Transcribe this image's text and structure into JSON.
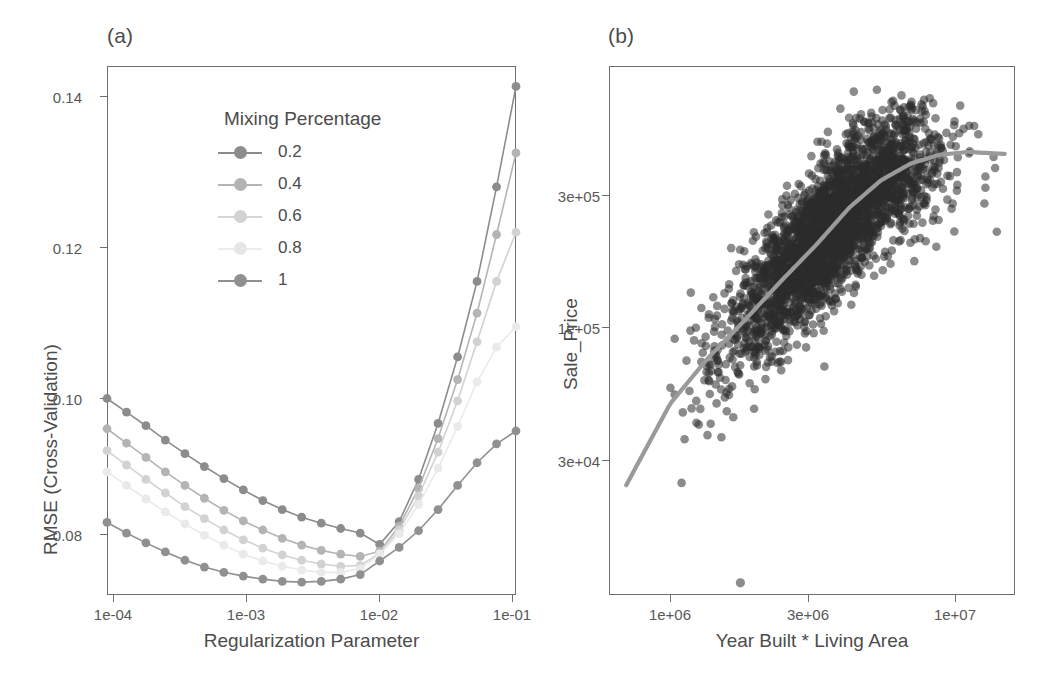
{
  "figure": {
    "panels": [
      {
        "tag": "(a)"
      },
      {
        "tag": "(b)"
      }
    ]
  },
  "chart_data": [
    {
      "type": "line",
      "panel": "(a)",
      "title": "",
      "xlabel": "Regularization Parameter",
      "ylabel": "RMSE (Cross-Validation)",
      "xscale": "log",
      "xlim": [
        0.0001,
        0.1
      ],
      "ylim": [
        0.0745,
        0.1445
      ],
      "xticks": [
        0.0001,
        0.001,
        0.01,
        0.1
      ],
      "xticklabels": [
        "1e-04",
        "1e-03",
        "1e-02",
        "1e-01"
      ],
      "yticks": [
        0.08,
        0.1,
        0.12,
        0.14
      ],
      "yticklabels": [
        "0.08",
        "0.10",
        "0.12",
        "0.14"
      ],
      "grid": false,
      "legend": {
        "title": "Mixing Percentage",
        "position": "inside-top-left",
        "entries": [
          "0.2",
          "0.4",
          "0.6",
          "0.8",
          "1"
        ]
      },
      "x": [
        0.0001,
        0.000139,
        0.000193,
        0.000268,
        0.000373,
        0.000518,
        0.00072,
        0.001,
        0.00139,
        0.00193,
        0.00268,
        0.00373,
        0.00518,
        0.0072,
        0.01,
        0.0139,
        0.0193,
        0.0268,
        0.0373,
        0.0518,
        0.072,
        0.1
      ],
      "series": [
        {
          "name": "0.2",
          "color": "#8c8c8c",
          "values": [
            0.1005,
            0.0987,
            0.0969,
            0.095,
            0.0932,
            0.0915,
            0.0899,
            0.0884,
            0.087,
            0.0858,
            0.0848,
            0.084,
            0.0833,
            0.0827,
            0.0812,
            0.0842,
            0.0898,
            0.0972,
            0.106,
            0.116,
            0.1285,
            0.1418
          ]
        },
        {
          "name": "0.4",
          "color": "#b4b4b4",
          "values": [
            0.0965,
            0.0946,
            0.0927,
            0.0908,
            0.089,
            0.0873,
            0.0857,
            0.0843,
            0.0831,
            0.082,
            0.0811,
            0.0804,
            0.0799,
            0.0796,
            0.0803,
            0.0836,
            0.0886,
            0.0952,
            0.103,
            0.1118,
            0.1222,
            0.133
          ]
        },
        {
          "name": "0.6",
          "color": "#d2d2d2",
          "values": [
            0.0936,
            0.0917,
            0.0898,
            0.088,
            0.0862,
            0.0846,
            0.0831,
            0.0818,
            0.0807,
            0.0798,
            0.0791,
            0.0786,
            0.0783,
            0.0784,
            0.08,
            0.0831,
            0.0876,
            0.0934,
            0.1002,
            0.108,
            0.116,
            0.1225
          ]
        },
        {
          "name": "0.8",
          "color": "#eaeaea",
          "values": [
            0.0908,
            0.089,
            0.0872,
            0.0855,
            0.0839,
            0.0824,
            0.0811,
            0.0799,
            0.079,
            0.0783,
            0.0778,
            0.0775,
            0.0775,
            0.078,
            0.0799,
            0.0826,
            0.0865,
            0.0913,
            0.0968,
            0.1027,
            0.1073,
            0.11
          ]
        },
        {
          "name": "1",
          "color": "#909090",
          "values": [
            0.0841,
            0.0827,
            0.0814,
            0.0802,
            0.0791,
            0.0782,
            0.0775,
            0.077,
            0.0766,
            0.0763,
            0.0762,
            0.0763,
            0.0766,
            0.0772,
            0.079,
            0.0808,
            0.083,
            0.0858,
            0.089,
            0.092,
            0.0945,
            0.0962
          ]
        }
      ]
    },
    {
      "type": "scatter",
      "panel": "(b)",
      "title": "",
      "xlabel": "Year Built * Living Area",
      "ylabel": "Sale_Price",
      "xscale": "log",
      "yscale": "log",
      "xlim": [
        560000,
        13000000
      ],
      "ylim": [
        13000,
        600000
      ],
      "xticks": [
        1000000,
        3000000,
        10000000
      ],
      "xticklabels": [
        "1e+06",
        "3e+06",
        "1e+07"
      ],
      "yticks": [
        30000,
        100000,
        300000
      ],
      "yticklabels": [
        "3e+04",
        "1e+05",
        "3e+05"
      ],
      "grid": false,
      "point_color": "#2b2b2b",
      "point_opacity": 0.55,
      "point_count": 2930,
      "smoother": {
        "name": "loess",
        "color": "#9a9a9a",
        "x": [
          680000,
          900000,
          1200000,
          1600000,
          2100000,
          2800000,
          3600000,
          4600000,
          5800000,
          7200000,
          9000000,
          11500000
        ],
        "y": [
          32000,
          52000,
          72000,
          95000,
          125000,
          165000,
          215000,
          262000,
          296000,
          315000,
          322000,
          318000
        ]
      }
    }
  ]
}
